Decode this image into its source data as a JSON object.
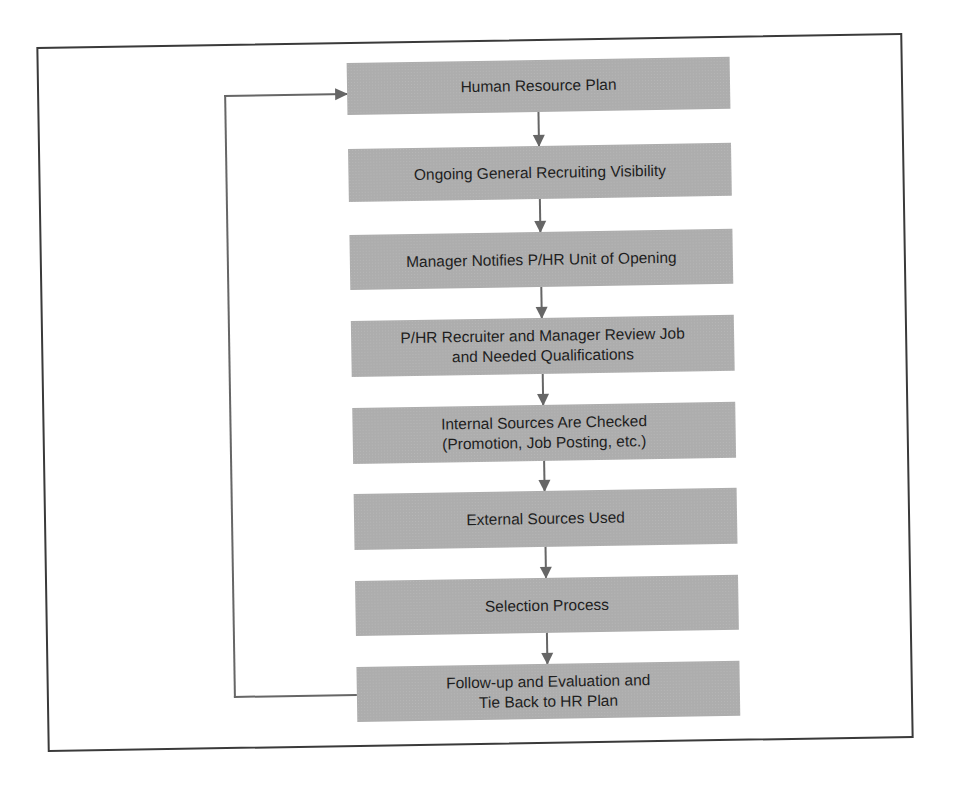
{
  "diagram": {
    "type": "flowchart",
    "direction": "top-to-bottom",
    "colors": {
      "box_fill": "#adadad",
      "arrow": "#666666",
      "frame_border": "#3a3a3a",
      "text": "#1e1e1e"
    },
    "steps": [
      {
        "label": "Human Resource Plan"
      },
      {
        "label": "Ongoing General Recruiting Visibility"
      },
      {
        "label": "Manager Notifies P/HR Unit of Opening"
      },
      {
        "label": "P/HR Recruiter and Manager Review Job\nand Needed Qualifications"
      },
      {
        "label": "Internal Sources Are Checked\n(Promotion, Job Posting, etc.)"
      },
      {
        "label": "External Sources Used"
      },
      {
        "label": "Selection Process"
      },
      {
        "label": "Follow-up and Evaluation and\nTie Back to HR Plan"
      }
    ],
    "feedback_loop": {
      "from": "Follow-up and Evaluation and Tie Back to HR Plan",
      "to": "Human Resource Plan"
    }
  }
}
